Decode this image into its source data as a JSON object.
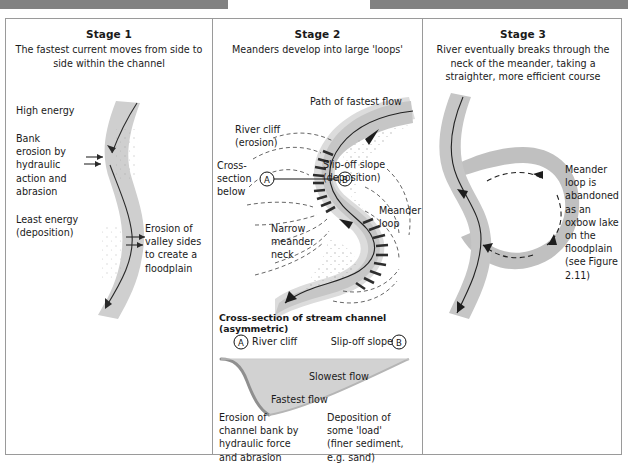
{
  "figure": {
    "kind": "three-stage-meander-formation-diagram",
    "top_bars": [
      "grey-bar-left",
      "grey-bar-right"
    ]
  },
  "colors": {
    "channel_fill": "#c9c9c9",
    "channel_fill_light": "#d8d8d8",
    "cliff_dark": "#2d2d2d",
    "deposition_stipple": "#bdbdbd",
    "border": "#9a9a9a",
    "top_bar": "#828282",
    "text": "#1a1a1a"
  },
  "stage1": {
    "title": "Stage 1",
    "subtitle": "The fastest current moves from side to side within the channel",
    "labels": {
      "high_energy": "High energy",
      "bank_erosion": "Bank erosion by hydraulic action and abrasion",
      "least_energy": "Least energy (deposition)",
      "erosion_valley": "Erosion of valley sides to create a floodplain"
    }
  },
  "stage2": {
    "title": "Stage 2",
    "subtitle": "Meanders develop into large 'loops'",
    "labels": {
      "path_fastest": "Path of fastest flow",
      "river_cliff": "River cliff (erosion)",
      "cross_section_below": "Cross-section below",
      "slip_off_slope": "Slip-off slope (deposition)",
      "meander_loop": "Meander loop",
      "narrow_neck": "Narrow meander neck",
      "marker_a": "A",
      "marker_b": "B"
    },
    "cross_section": {
      "title": "Cross-section of stream channel (asymmetric)",
      "marker_a": "A",
      "marker_b": "B",
      "left_label": "River cliff",
      "right_label": "Slip-off slope",
      "slowest_flow": "Slowest flow",
      "fastest_flow": "Fastest flow",
      "left_note": "Erosion of channel bank by hydraulic force and abrasion",
      "right_note": "Deposition of some 'load' (finer sediment, e.g. sand)"
    }
  },
  "stage3": {
    "title": "Stage 3",
    "subtitle": "River eventually breaks through the neck of the meander, taking a straighter, more efficient course",
    "note_pre": "Meander loop is abandoned as an ",
    "note_bold": "oxbow lake",
    "note_post": " on the floodplain (see Figure 2.11)"
  }
}
